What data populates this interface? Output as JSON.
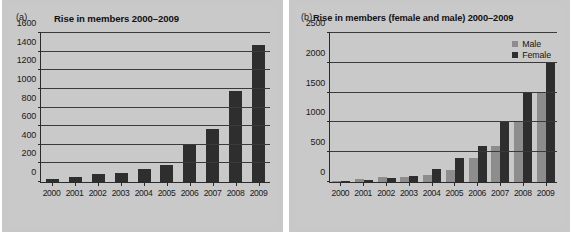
{
  "figure": {
    "panels": [
      {
        "tag": "(a)"
      },
      {
        "tag": "(b)"
      }
    ]
  },
  "chart_data": [
    {
      "type": "bar",
      "panel_label": "(a)",
      "title": "Rise in members 2000–2009",
      "xlabel": "",
      "ylabel": "",
      "categories": [
        "2000",
        "2001",
        "2002",
        "2003",
        "2004",
        "2005",
        "2006",
        "2007",
        "2008",
        "2009"
      ],
      "values": [
        30,
        55,
        85,
        95,
        135,
        185,
        400,
        570,
        975,
        1470
      ],
      "yticks": [
        0,
        200,
        400,
        600,
        800,
        1000,
        1200,
        1400,
        1600
      ],
      "ylim": [
        0,
        1600
      ],
      "grid": true,
      "legend": null,
      "bar_color": "#2e2e2e"
    },
    {
      "type": "bar",
      "panel_label": "(b)",
      "title": "Rise in members (female and male) 2000–2009",
      "xlabel": "",
      "ylabel": "",
      "categories": [
        "2000",
        "2001",
        "2002",
        "2003",
        "2004",
        "2005",
        "2006",
        "2007",
        "2008",
        "2009"
      ],
      "series": [
        {
          "name": "Male",
          "color": "#8d8d8d",
          "values": [
            15,
            50,
            80,
            90,
            120,
            200,
            400,
            600,
            1000,
            1500
          ]
        },
        {
          "name": "Female",
          "color": "#2e2e2e",
          "values": [
            10,
            30,
            65,
            100,
            210,
            400,
            600,
            1000,
            1500,
            2010
          ]
        }
      ],
      "yticks": [
        0,
        500,
        1000,
        1500,
        2000,
        2500
      ],
      "ylim": [
        0,
        2500
      ],
      "grid": true,
      "legend_position": "top-right"
    }
  ]
}
